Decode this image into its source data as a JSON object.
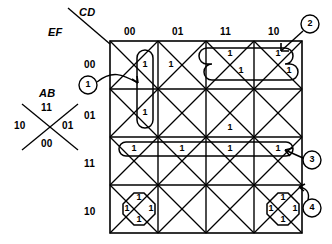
{
  "diagram": {
    "type": "veitch-map",
    "ink_color": "#000000",
    "paper_color": "#ffffff",
    "axis_labels": {
      "columns_var": "CD",
      "rows_var": "EF",
      "cell_var": "AB"
    },
    "column_headers": [
      "00",
      "01",
      "11",
      "10"
    ],
    "row_headers": [
      "00",
      "01",
      "11",
      "10"
    ],
    "cell_legend": {
      "caption": "AB",
      "top": "11",
      "left": "10",
      "right": "01",
      "bottom": "00"
    },
    "cell_value_text": "1",
    "ones": [
      {
        "row": "00",
        "col": "00",
        "pos": "right",
        "ab": "01",
        "group": 1
      },
      {
        "row": "00",
        "col": "01",
        "pos": "left",
        "ab": "10",
        "group": null
      },
      {
        "row": "00",
        "col": "11",
        "pos": "top",
        "ab": "11",
        "group": 2
      },
      {
        "row": "00",
        "col": "11",
        "pos": "right",
        "ab": "01",
        "group": 2
      },
      {
        "row": "00",
        "col": "10",
        "pos": "top",
        "ab": "11",
        "group": 2
      },
      {
        "row": "00",
        "col": "10",
        "pos": "right",
        "ab": "01",
        "group": 2
      },
      {
        "row": "01",
        "col": "00",
        "pos": "right",
        "ab": "01",
        "group": 1
      },
      {
        "row": "01",
        "col": "11",
        "pos": "bottom",
        "ab": "00",
        "group": null
      },
      {
        "row": "11",
        "col": "00",
        "pos": "top",
        "ab": "11",
        "group": 3
      },
      {
        "row": "11",
        "col": "01",
        "pos": "top",
        "ab": "11",
        "group": 3
      },
      {
        "row": "11",
        "col": "11",
        "pos": "top",
        "ab": "11",
        "group": 3
      },
      {
        "row": "11",
        "col": "10",
        "pos": "top",
        "ab": "11",
        "group": 3
      },
      {
        "row": "10",
        "col": "00",
        "pos": "top",
        "ab": "11",
        "group": 4
      },
      {
        "row": "10",
        "col": "00",
        "pos": "left",
        "ab": "10",
        "group": 4
      },
      {
        "row": "10",
        "col": "00",
        "pos": "right",
        "ab": "01",
        "group": 4
      },
      {
        "row": "10",
        "col": "00",
        "pos": "bottom",
        "ab": "00",
        "group": 4
      },
      {
        "row": "10",
        "col": "10",
        "pos": "top",
        "ab": "11",
        "group": 4
      },
      {
        "row": "10",
        "col": "10",
        "pos": "left",
        "ab": "10",
        "group": 4
      },
      {
        "row": "10",
        "col": "10",
        "pos": "right",
        "ab": "01",
        "group": 4
      },
      {
        "row": "10",
        "col": "10",
        "pos": "bottom",
        "ab": "00",
        "group": 4
      }
    ],
    "markers": [
      {
        "label": "1",
        "placement": "left-outside",
        "arrow": "curved-right"
      },
      {
        "label": "2",
        "placement": "top-right",
        "arrow": "down-left"
      },
      {
        "label": "3",
        "placement": "right-middle",
        "arrow": "up-left"
      },
      {
        "label": "4",
        "placement": "right-lower",
        "arrow": "up"
      }
    ],
    "groups": [
      {
        "label": "1",
        "shape": "vertical-pair",
        "cells": 2
      },
      {
        "label": "2",
        "shape": "slanted-quad",
        "cells": 4
      },
      {
        "label": "3",
        "shape": "horizontal-quad",
        "cells": 4
      },
      {
        "label": "4",
        "shape": "diamond-quad",
        "cells": 4
      }
    ]
  }
}
